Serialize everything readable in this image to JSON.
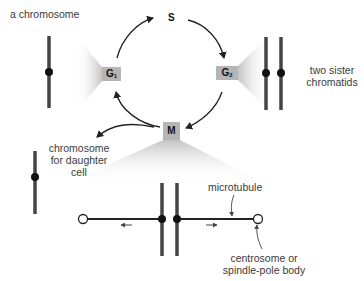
{
  "diagram": {
    "type": "cell-cycle",
    "phases": {
      "g1": {
        "label": "G",
        "sub": "1"
      },
      "s": {
        "label": "S"
      },
      "g2": {
        "label": "G",
        "sub": "2"
      },
      "m": {
        "label": "M"
      }
    },
    "labels": {
      "chromosome": "a chromosome",
      "sister_chromatids_line1": "two sister",
      "sister_chromatids_line2": "chromatids",
      "daughter_line1": "chromosome",
      "daughter_line2": "for daughter",
      "daughter_line3": "cell",
      "microtubule": "microtubule",
      "centrosome_line1": "centrosome or",
      "centrosome_line2": "spindle-pole body"
    },
    "colors": {
      "chromosome": "#444444",
      "centromere": "#111111",
      "phase_box": "#b5b5b5",
      "funnel": "#cfcfcf",
      "arrow": "#222222"
    }
  }
}
